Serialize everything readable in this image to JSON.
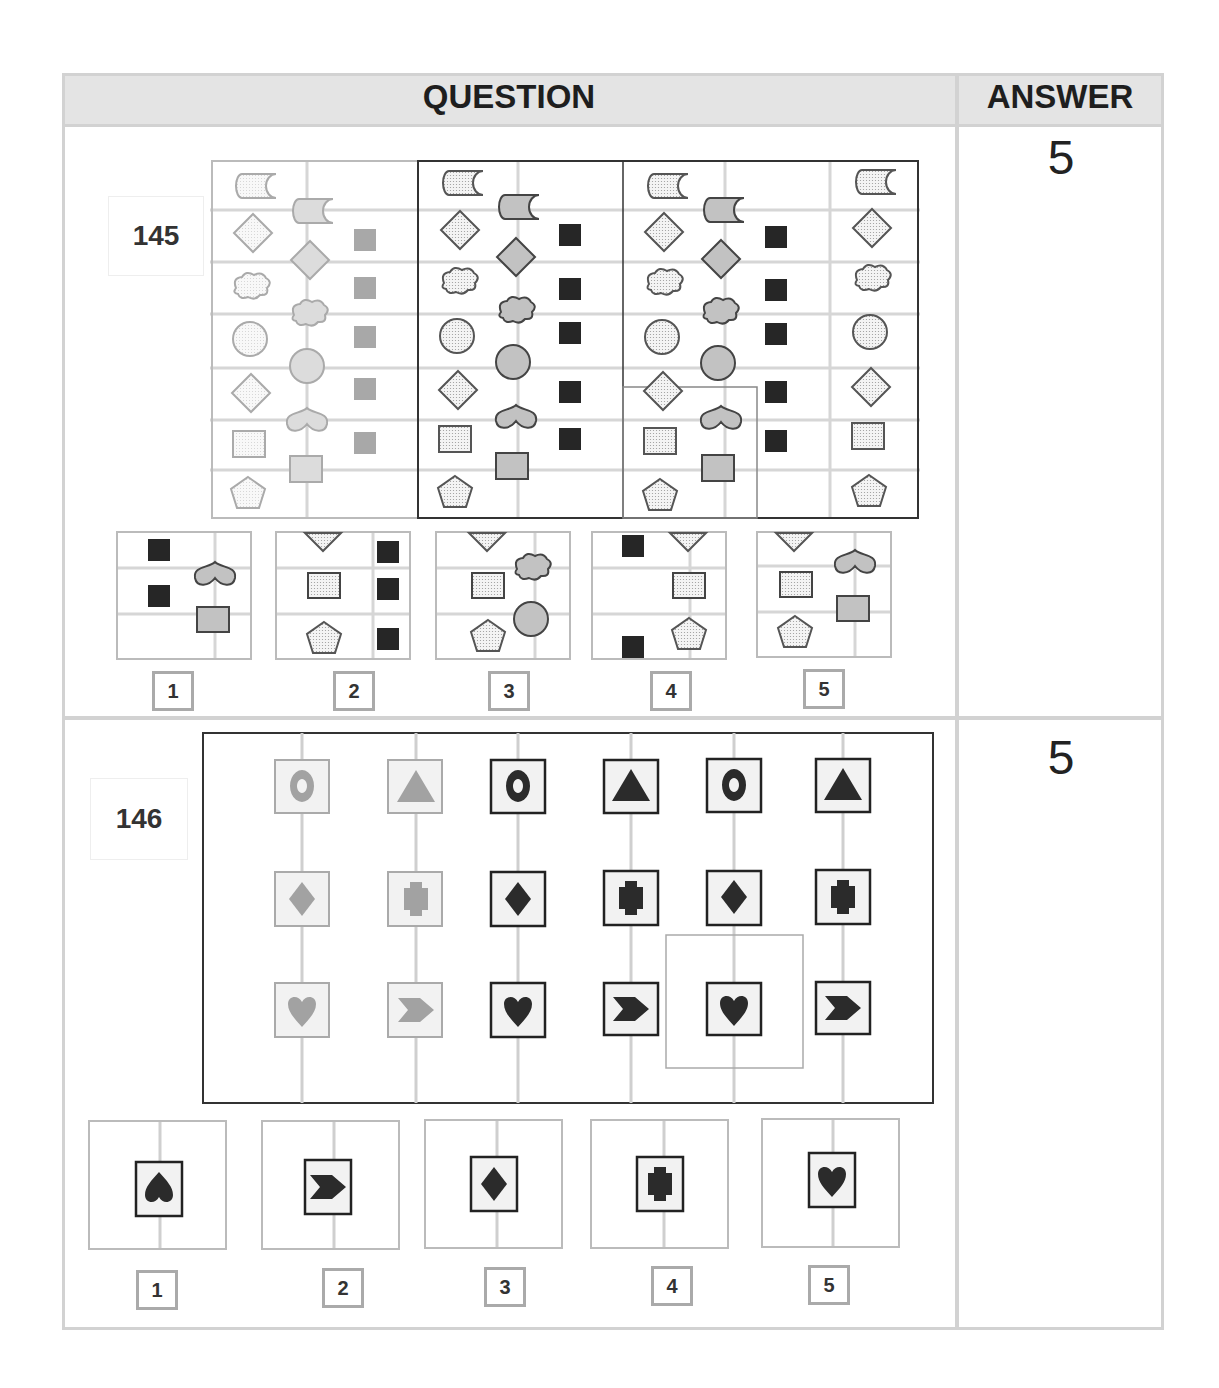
{
  "header": {
    "question_label": "QUESTION",
    "answer_label": "ANSWER"
  },
  "questions": [
    {
      "number": "145",
      "answer": "5",
      "description": "Grid puzzle of shapes in staggered columns (light dotted / grey / black); find the missing boxed section",
      "options": [
        {
          "label": "1",
          "content": "black squares left, grey heart and grey square right"
        },
        {
          "label": "2",
          "content": "dotted triangle, dotted square, dotted pentagon with three black squares"
        },
        {
          "label": "3",
          "content": "dotted triangle, dotted square, dotted pentagon with grey cloud and grey circle"
        },
        {
          "label": "4",
          "content": "two black squares with dotted triangle, square, pentagon"
        },
        {
          "label": "5",
          "content": "dotted triangle, square, pentagon with grey heart and grey square"
        }
      ]
    },
    {
      "number": "146",
      "answer": "5",
      "description": "Symbol grid: ring/triangle, diamond/cross, heart/chevron in grey and black boxed tiles",
      "options": [
        {
          "label": "1",
          "content": "spade-like inverted heart"
        },
        {
          "label": "2",
          "content": "chevron"
        },
        {
          "label": "3",
          "content": "diamond"
        },
        {
          "label": "4",
          "content": "cross"
        },
        {
          "label": "5",
          "content": "heart"
        }
      ]
    }
  ],
  "colors": {
    "border": "#d2d2d2",
    "header_bg": "#e4e4e4",
    "grey_shape": "#bdbdbd",
    "dark_shape": "#2b2b2b",
    "light_grid": "#cfcfcf"
  }
}
